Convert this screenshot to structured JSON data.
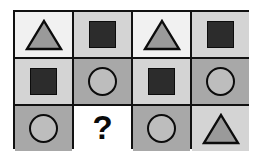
{
  "puzzle": {
    "type": "matrix-reasoning",
    "rows": 3,
    "columns": 4,
    "missing_cell": {
      "row": 3,
      "column": 2
    },
    "missing_marker": "?",
    "palette": {
      "outer_border": "#111111",
      "grid_line": "#111111",
      "cell_bg_light": "#f1f1f1",
      "cell_bg_pale": "#d4d4d4",
      "cell_bg_mid": "#a8a8a8",
      "cell_bg_white": "#ffffff",
      "shape_fill_gray": "#9a9a9a",
      "shape_fill_light_gray": "#bdbdbd",
      "shape_fill_dark": "#2c2c2c",
      "shape_outline": "#0c0c0c",
      "question_mark_color": "#0a0a0a"
    },
    "cells": [
      {
        "index": 0,
        "row": 1,
        "column": 1,
        "shape": "triangle",
        "label": "triangle",
        "background": "#f1f1f1",
        "fill": "#9a9a9a",
        "outline": "#0c0c0c"
      },
      {
        "index": 1,
        "row": 1,
        "column": 2,
        "shape": "square",
        "label": "square",
        "background": "#d4d4d4",
        "fill": "#2c2c2c",
        "outline": "#0c0c0c"
      },
      {
        "index": 2,
        "row": 1,
        "column": 3,
        "shape": "triangle",
        "label": "triangle",
        "background": "#f1f1f1",
        "fill": "#9a9a9a",
        "outline": "#0c0c0c"
      },
      {
        "index": 3,
        "row": 1,
        "column": 4,
        "shape": "square",
        "label": "square",
        "background": "#d4d4d4",
        "fill": "#2c2c2c",
        "outline": "#0c0c0c"
      },
      {
        "index": 4,
        "row": 2,
        "column": 1,
        "shape": "square",
        "label": "square",
        "background": "#d4d4d4",
        "fill": "#2c2c2c",
        "outline": "#0c0c0c"
      },
      {
        "index": 5,
        "row": 2,
        "column": 2,
        "shape": "circle",
        "label": "circle",
        "background": "#a8a8a8",
        "fill": "#bdbdbd",
        "outline": "#0c0c0c"
      },
      {
        "index": 6,
        "row": 2,
        "column": 3,
        "shape": "square",
        "label": "square",
        "background": "#d4d4d4",
        "fill": "#2c2c2c",
        "outline": "#0c0c0c"
      },
      {
        "index": 7,
        "row": 2,
        "column": 4,
        "shape": "circle",
        "label": "circle",
        "background": "#a8a8a8",
        "fill": "#bdbdbd",
        "outline": "#0c0c0c"
      },
      {
        "index": 8,
        "row": 3,
        "column": 1,
        "shape": "circle",
        "label": "circle",
        "background": "#a8a8a8",
        "fill": "#bdbdbd",
        "outline": "#0c0c0c"
      },
      {
        "index": 9,
        "row": 3,
        "column": 2,
        "shape": "question",
        "label": "?",
        "background": "#ffffff",
        "fill": "#0a0a0a",
        "outline": "#0a0a0a"
      },
      {
        "index": 10,
        "row": 3,
        "column": 3,
        "shape": "circle",
        "label": "circle",
        "background": "#a8a8a8",
        "fill": "#bdbdbd",
        "outline": "#0c0c0c"
      },
      {
        "index": 11,
        "row": 3,
        "column": 4,
        "shape": "triangle",
        "label": "triangle",
        "background": "#d4d4d4",
        "fill": "#9a9a9a",
        "outline": "#0c0c0c"
      }
    ]
  }
}
